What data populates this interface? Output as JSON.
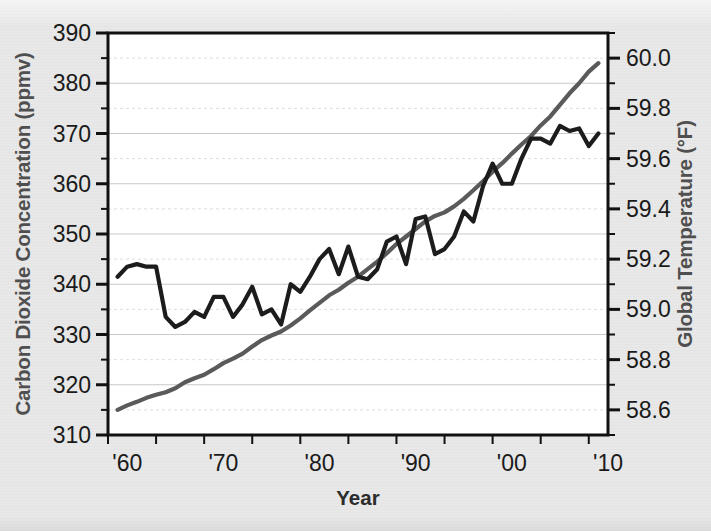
{
  "figure": {
    "background_color": "#e8e8e8",
    "plot_background_color": "#ffffff",
    "border_color": "#111111"
  },
  "axes": {
    "left": {
      "title": "Carbon Dioxide Concentration (ppmv)",
      "tick_labels": [
        "390",
        "380",
        "370",
        "360",
        "350",
        "340",
        "330",
        "320",
        "310"
      ],
      "tick_values": [
        390,
        380,
        370,
        360,
        350,
        340,
        330,
        320,
        310
      ],
      "range": [
        310,
        390
      ],
      "minor_tick_step": 5
    },
    "right": {
      "title": "Global Temperature (°F)",
      "tick_labels": [
        "60.0",
        "59.8",
        "59.6",
        "59.4",
        "59.2",
        "59.0",
        "58.8",
        "58.6"
      ],
      "tick_values": [
        60.0,
        59.8,
        59.6,
        59.4,
        59.2,
        59.0,
        58.8,
        58.6
      ],
      "range": [
        58.5,
        60.1
      ],
      "minor_tick_step": 0.1
    },
    "bottom": {
      "title": "Year",
      "tick_labels": [
        "'60",
        "'70",
        "'80",
        "'90",
        "'00",
        "'10"
      ],
      "tick_values": [
        1960,
        1970,
        1980,
        1990,
        2000,
        2010
      ],
      "range": [
        1958,
        2010
      ],
      "minor_tick_step": 5
    }
  },
  "series_style": {
    "co2_color": "#5a5a5a",
    "temperature_color": "#1c1c1c",
    "line_width": 4.2,
    "major_grid_color": "#c9c9c9",
    "minor_grid_color": "#dedede"
  },
  "chart_data": {
    "type": "line",
    "title": "",
    "subtitle": "",
    "xlabel": "Year",
    "ylabel": "Carbon Dioxide Concentration (ppmv)",
    "y2label": "Global Temperature (°F)",
    "xlim": [
      1958,
      2010
    ],
    "ylim": [
      310,
      390
    ],
    "y2lim": [
      58.5,
      60.1
    ],
    "grid": true,
    "legend": "none",
    "x": [
      1959,
      1960,
      1961,
      1962,
      1963,
      1964,
      1965,
      1966,
      1967,
      1968,
      1969,
      1970,
      1971,
      1972,
      1973,
      1974,
      1975,
      1976,
      1977,
      1978,
      1979,
      1980,
      1981,
      1982,
      1983,
      1984,
      1985,
      1986,
      1987,
      1988,
      1989,
      1990,
      1991,
      1992,
      1993,
      1994,
      1995,
      1996,
      1997,
      1998,
      1999,
      2000,
      2001,
      2002,
      2003,
      2004,
      2005,
      2006,
      2007,
      2008,
      2009
    ],
    "series": [
      {
        "name": "Carbon Dioxide Concentration",
        "axis": "left",
        "units": "ppmv",
        "color": "#5a5a5a",
        "values": [
          315.0,
          315.9,
          316.6,
          317.4,
          318.0,
          318.5,
          319.3,
          320.5,
          321.3,
          322.0,
          323.1,
          324.3,
          325.2,
          326.2,
          327.6,
          328.9,
          329.8,
          330.6,
          331.8,
          333.2,
          334.8,
          336.3,
          337.8,
          338.9,
          340.3,
          341.5,
          343.0,
          344.5,
          346.2,
          348.0,
          349.5,
          351.0,
          352.5,
          353.6,
          354.3,
          355.5,
          357.0,
          358.7,
          360.5,
          362.4,
          364.1,
          366.0,
          367.8,
          369.5,
          371.6,
          373.4,
          375.7,
          378.0,
          380.0,
          382.3,
          384.0
        ]
      },
      {
        "name": "Global Temperature",
        "axis": "right",
        "units": "°F",
        "color": "#1c1c1c",
        "values": [
          59.13,
          59.17,
          59.18,
          59.17,
          59.17,
          58.97,
          58.93,
          58.95,
          58.99,
          58.97,
          59.05,
          59.05,
          58.97,
          59.02,
          59.09,
          58.98,
          59.0,
          58.94,
          59.1,
          59.07,
          59.13,
          59.2,
          59.24,
          59.14,
          59.25,
          59.13,
          59.12,
          59.16,
          59.27,
          59.29,
          59.18,
          59.36,
          59.37,
          59.22,
          59.24,
          59.29,
          59.39,
          59.35,
          59.49,
          59.58,
          59.5,
          59.5,
          59.6,
          59.68,
          59.68,
          59.66,
          59.73,
          59.71,
          59.72,
          59.65,
          59.7
        ]
      }
    ]
  }
}
